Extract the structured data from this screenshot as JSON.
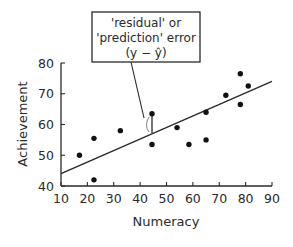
{
  "chart_data": {
    "type": "scatter",
    "title": "",
    "xlabel": "Numeracy",
    "ylabel": "Achievement",
    "xlim": [
      10,
      90
    ],
    "ylim": [
      40,
      80
    ],
    "x_ticks": [
      10,
      20,
      30,
      40,
      50,
      60,
      70,
      80,
      90
    ],
    "y_ticks": [
      40,
      50,
      60,
      70,
      80
    ],
    "grid": false,
    "legend": null,
    "series": [
      {
        "name": "observations",
        "points": [
          {
            "x": 17,
            "y": 50
          },
          {
            "x": 22.5,
            "y": 55.5
          },
          {
            "x": 22.5,
            "y": 42
          },
          {
            "x": 32.5,
            "y": 58
          },
          {
            "x": 44.5,
            "y": 63.5
          },
          {
            "x": 44.5,
            "y": 53.5
          },
          {
            "x": 54,
            "y": 59
          },
          {
            "x": 58.5,
            "y": 53.5
          },
          {
            "x": 65,
            "y": 64
          },
          {
            "x": 65,
            "y": 55
          },
          {
            "x": 72.5,
            "y": 69.5
          },
          {
            "x": 78,
            "y": 76.5
          },
          {
            "x": 81,
            "y": 72.5
          },
          {
            "x": 78,
            "y": 66.5
          }
        ]
      }
    ],
    "regression_line": {
      "x1": 10,
      "y1": 44,
      "x2": 90,
      "y2": 74
    },
    "residual_marker": {
      "x": 44.5,
      "y_observed": 63.5,
      "y_predicted": 57.2
    },
    "annotation": {
      "lines": [
        "'residual' or",
        "'prediction' error",
        "(y − ŷ)"
      ]
    }
  }
}
